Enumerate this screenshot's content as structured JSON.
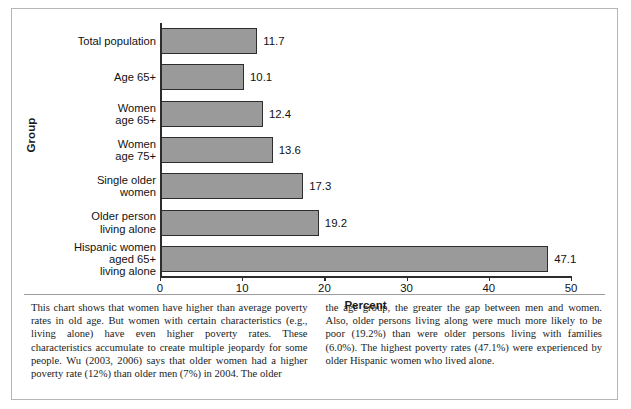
{
  "figure": {
    "background_color": "#ffffff",
    "border_color": "#b6b6b6"
  },
  "chart_data": {
    "type": "bar",
    "orientation": "horizontal",
    "title": "",
    "xlabel": "Percent",
    "ylabel": "Group",
    "xlim": [
      0,
      50
    ],
    "xticks": [
      "0",
      "10",
      "20",
      "30",
      "40",
      "50"
    ],
    "grid": false,
    "legend": false,
    "bar_color": "#9a9a9a",
    "bar_edge_color": "#2e2e2e",
    "categories": [
      "Total population",
      "Age 65+",
      "Women\nage 65+",
      "Women\nage 75+",
      "Single older\nwomen",
      "Older person\nliving alone",
      "Hispanic women\naged 65+\nliving alone"
    ],
    "values": [
      11.7,
      10.1,
      12.4,
      13.6,
      17.3,
      19.2,
      47.1
    ],
    "value_labels": [
      "11.7",
      "10.1",
      "12.4",
      "13.6",
      "17.3",
      "19.2",
      "47.1"
    ]
  },
  "caption": {
    "left_column": "This chart shows that women have higher than average poverty rates in old age. But women with certain characteristics (e.g., living alone) have even higher poverty rates. These characteristics accumulate to create multiple jeopardy for some people. Wu (2003, 2006) says that older women had a higher poverty rate (12%) than older men (7%) in 2004. The older",
    "right_column": "the age group, the greater the gap between men and women. Also, older persons living along were much more likely to be poor (19.2%) than were older persons living with families (6.0%). The highest poverty rates (47.1%) were experienced by older Hispanic women who lived alone."
  }
}
